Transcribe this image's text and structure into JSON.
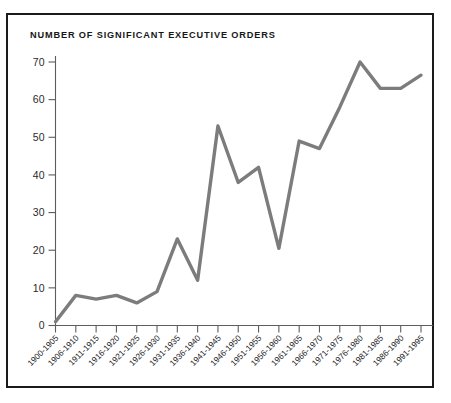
{
  "figure": {
    "title": "NUMBER OF SIGNIFICANT EXECUTIVE ORDERS",
    "frame_color": "#1a1a18",
    "background": "#ffffff"
  },
  "chart_data": {
    "type": "line",
    "title": "NUMBER OF SIGNIFICANT EXECUTIVE ORDERS",
    "xlabel": "",
    "ylabel": "",
    "ylim": [
      0,
      73
    ],
    "yticks": [
      0,
      10,
      20,
      30,
      40,
      50,
      60,
      70
    ],
    "ytick_labels": [
      "0",
      "10",
      "20",
      "30",
      "40",
      "50",
      "60",
      "70"
    ],
    "grid": false,
    "legend": "none",
    "line_color": "#7c7c7c",
    "categories": [
      "1900-1905",
      "1906-1910",
      "1911-1915",
      "1916-1920",
      "1921-1925",
      "1926-1930",
      "1931-1935",
      "1936-1940",
      "1941-1945",
      "1946-1950",
      "1951-1955",
      "1956-1960",
      "1961-1965",
      "1966-1970",
      "1971-1975",
      "1976-1980",
      "1981-1985",
      "1986-1990",
      "1991-1995"
    ],
    "values": [
      1,
      8,
      7,
      8,
      6,
      9,
      23,
      12,
      53,
      38,
      42,
      20.5,
      49,
      47,
      58,
      70,
      63,
      63,
      66.5
    ]
  }
}
